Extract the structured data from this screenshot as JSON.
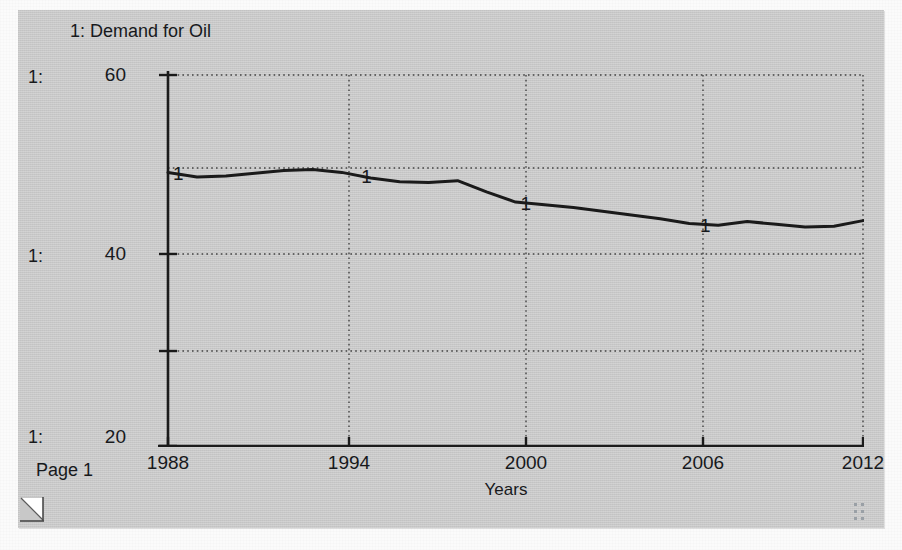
{
  "window": {
    "title": "1: Demand for Oil",
    "page_label": "Page 1",
    "background_color": "#c8c8c8",
    "curl_handle_icon": "page-curl-resize-icon",
    "grip_icon": "resize-grip-icon"
  },
  "series_gutter": {
    "keys": [
      "1:",
      "1:",
      "1:"
    ]
  },
  "chart_data": {
    "type": "line",
    "title": "1: Demand for Oil",
    "xlabel": "Years",
    "ylabel": "",
    "xlim": [
      1988,
      2012
    ],
    "ylim": [
      20,
      60
    ],
    "xticks": [
      1988,
      1994,
      2000,
      2006,
      2012
    ],
    "xticklabels": [
      "1988",
      "1994",
      "2000",
      "2006",
      "2012"
    ],
    "yticks": [
      20,
      40,
      60
    ],
    "yticklabels": [
      "20",
      "40",
      "60"
    ],
    "y_gridlines": [
      20,
      30,
      40,
      50,
      60
    ],
    "grid": true,
    "grid_style": "dotted",
    "legend": "none",
    "line_color": "#1a1a1a",
    "line_width": 3,
    "series": [
      {
        "name": "1",
        "label": "Demand for Oil",
        "marker_label": "1",
        "marker_years": [
          1988,
          1994.5,
          2000,
          2006.2
        ],
        "x": [
          1988,
          1989,
          1990,
          1991,
          1992,
          1993,
          1994,
          1995,
          1996,
          1997,
          1998,
          1999,
          2000,
          2001,
          2002,
          2003,
          2004,
          2005,
          2006,
          2007,
          2008,
          2009,
          2010,
          2011,
          2012
        ],
        "values": [
          49.5,
          49.0,
          49.1,
          49.4,
          49.7,
          49.8,
          49.5,
          48.9,
          48.5,
          48.4,
          48.6,
          47.4,
          46.3,
          46.0,
          45.7,
          45.3,
          44.9,
          44.5,
          44.0,
          43.8,
          44.2,
          43.9,
          43.6,
          43.7,
          44.3
        ]
      }
    ]
  },
  "axis_labels": {
    "x_title": "Years"
  }
}
